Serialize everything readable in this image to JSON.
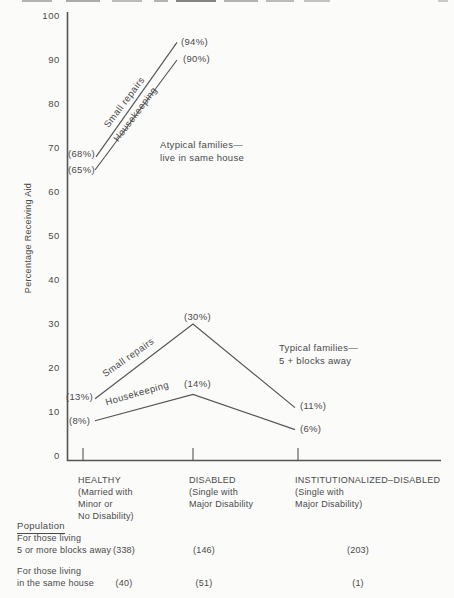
{
  "colors": {
    "ink": "#4a4a4a",
    "line": "#555555",
    "background": "#fbfbfa"
  },
  "chart_data": {
    "type": "line",
    "title": "",
    "xlabel": "",
    "ylabel": "Percentage Receiving Aid",
    "ylim": [
      0,
      100
    ],
    "yticks": [
      100,
      90,
      80,
      70,
      60,
      50,
      40,
      30,
      20,
      10,
      0
    ],
    "grid": false,
    "legend_position": "labels-on-lines",
    "categories": [
      {
        "name": "HEALTHY",
        "sub_lines": [
          "(Married with",
          "Minor or",
          "No Disability)"
        ]
      },
      {
        "name": "DISABLED",
        "sub_lines": [
          "(Single with",
          "Major Disability"
        ]
      },
      {
        "name": "INSTITUTIONALIZED–DISABLED",
        "sub_lines": [
          "(Single with",
          "Major Disability)"
        ]
      }
    ],
    "series": [
      {
        "name": "Small repairs",
        "group": "atypical",
        "values": [
          68,
          94,
          null
        ],
        "point_labels": [
          "(68%)",
          "(94%)",
          null
        ]
      },
      {
        "name": "Housekeeping",
        "group": "atypical",
        "values": [
          65,
          90,
          null
        ],
        "point_labels": [
          "(65%)",
          "(90%)",
          null
        ]
      },
      {
        "name": "Small repairs",
        "group": "typical",
        "values": [
          13,
          30,
          11
        ],
        "point_labels": [
          "(13%)",
          "(30%)",
          "(11%)"
        ]
      },
      {
        "name": "Housekeeping",
        "group": "typical",
        "values": [
          8,
          14,
          6
        ],
        "point_labels": [
          "(8%)",
          "(14%)",
          "(6%)"
        ]
      }
    ],
    "annotations": [
      {
        "id": "atypical",
        "lines": [
          "Atypical families—",
          "live in same house"
        ]
      },
      {
        "id": "typical",
        "lines": [
          "Typical families—",
          "5 +  blocks away"
        ]
      }
    ]
  },
  "population": {
    "heading": "Population",
    "rows": [
      {
        "label_lines": [
          "For those living",
          "5 or more blocks away"
        ],
        "values": [
          "(338)",
          "(146)",
          "(203)"
        ]
      },
      {
        "label_lines": [
          "For those living",
          "in the same house"
        ],
        "values": [
          "(40)",
          "(51)",
          "(1)"
        ]
      }
    ]
  }
}
